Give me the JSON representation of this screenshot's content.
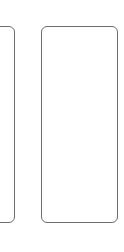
{
  "panels": [
    {
      "id": "left",
      "partially_visible": true,
      "content": ""
    },
    {
      "id": "right",
      "partially_visible": false,
      "content": ""
    }
  ],
  "colors": {
    "background": "#ffffff",
    "border": "#6e6e6e"
  }
}
